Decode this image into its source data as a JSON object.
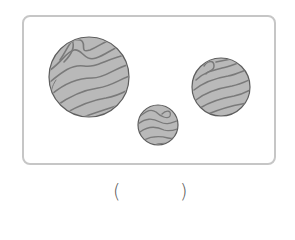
{
  "figure": {
    "items": [
      {
        "name": "large-log",
        "cx": 89,
        "cy": 77,
        "r": 40
      },
      {
        "name": "small-log",
        "cx": 158,
        "cy": 125,
        "r": 20
      },
      {
        "name": "medium-log",
        "cx": 221,
        "cy": 87,
        "r": 29
      }
    ],
    "colors": {
      "log_fill": "#b9b9b9",
      "grain_line": "#7a7a7a",
      "log_outline": "#5e5e5e",
      "frame_border": "#c6c6c6"
    }
  },
  "answer": {
    "open_paren": "(",
    "close_paren": ")",
    "value": ""
  }
}
